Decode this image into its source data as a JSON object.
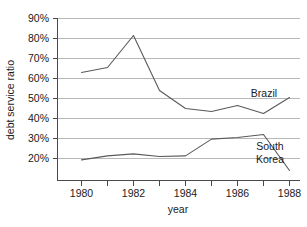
{
  "chart_data": {
    "type": "line",
    "title": "",
    "xlabel": "year",
    "ylabel": "debt service ratio",
    "x": [
      1980,
      1981,
      1982,
      1983,
      1984,
      1985,
      1986,
      1987,
      1988
    ],
    "xlim": [
      1979.5,
      1988.7
    ],
    "ylim": [
      14,
      90
    ],
    "xticks": [
      1980,
      1981,
      1982,
      1983,
      1984,
      1985,
      1986,
      1987,
      1988
    ],
    "xtick_labels": [
      "1980",
      "",
      "1982",
      "",
      "1984",
      "",
      "1986",
      "",
      "1988"
    ],
    "yticks": [
      20,
      30,
      40,
      50,
      60,
      70,
      80,
      90
    ],
    "ytick_labels": [
      "20%",
      "30%",
      "40%",
      "50%",
      "60%",
      "70%",
      "80%",
      "90%"
    ],
    "grid": true,
    "grid_axis": "y",
    "legend": "inline-labels",
    "series": [
      {
        "name": "Brazil",
        "label_text": "Brazil",
        "color": "#5a5a5a",
        "values": [
          63,
          65.5,
          81.5,
          54,
          45,
          43.5,
          46.5,
          42.5,
          50.5
        ]
      },
      {
        "name": "South Korea",
        "label_text": "South Korea",
        "label_line1": "South",
        "label_line2": "Korea",
        "color": "#5a5a5a",
        "values": [
          19.3,
          21.3,
          22.3,
          21,
          21.3,
          29.7,
          30.5,
          32,
          14
        ]
      }
    ]
  },
  "axis": {
    "y_title": "debt service ratio",
    "x_title": "year"
  },
  "ytick_labels": {
    "t90": "90%",
    "t80": "80%",
    "t70": "70%",
    "t60": "60%",
    "t50": "50%",
    "t40": "40%",
    "t30": "30%",
    "t20": "20%"
  },
  "xtick_labels": {
    "t1980": "1980",
    "t1982": "1982",
    "t1984": "1984",
    "t1986": "1986",
    "t1988": "1988"
  },
  "series_labels": {
    "brazil": "Brazil",
    "korea_line1": "South",
    "korea_line2": "Korea"
  }
}
